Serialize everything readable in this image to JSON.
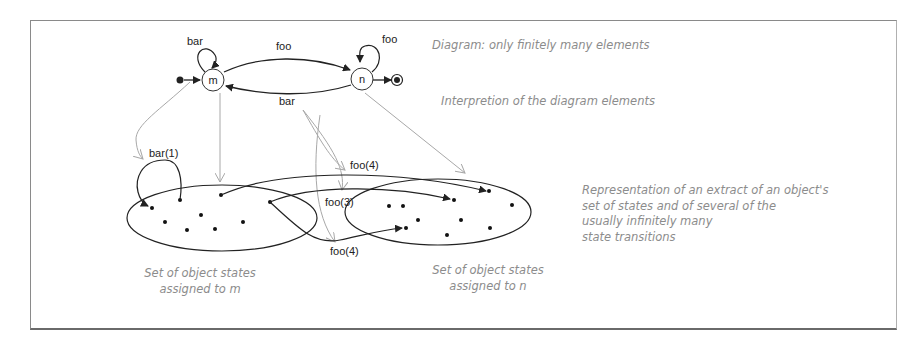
{
  "diagram": {
    "states": [
      {
        "id": "m",
        "label": "m"
      },
      {
        "id": "n",
        "label": "n"
      }
    ],
    "transitions": [
      {
        "from": "m",
        "to": "m",
        "label": "bar"
      },
      {
        "from": "m",
        "to": "n",
        "label": "foo"
      },
      {
        "from": "n",
        "to": "m",
        "label": "bar"
      },
      {
        "from": "n",
        "to": "n",
        "label": "foo"
      }
    ],
    "has_initial_state": true,
    "has_final_state": true
  },
  "instance_transitions": [
    {
      "label": "bar(1)"
    },
    {
      "label": "foo(4)",
      "position": "upper"
    },
    {
      "label": "foo(3)"
    },
    {
      "label": "foo(4)",
      "position": "lower"
    }
  ],
  "annotations": {
    "diagram_note": "Diagram: only finitely many elements",
    "interpretation_note": "Interpretion of the diagram elements",
    "representation_note": [
      "Representation of an extract of an object's",
      "set of states and of several of the",
      "usually infinitely many",
      "state transitions"
    ],
    "set_m": [
      "Set of object states",
      "assigned to m"
    ],
    "set_n": [
      "Set of object states",
      "assigned to n"
    ]
  },
  "colors": {
    "line": "#222222",
    "mapping_arrow": "#a8a8a8",
    "note_text": "#8c8c8c",
    "frame": "#8a8a8a"
  }
}
